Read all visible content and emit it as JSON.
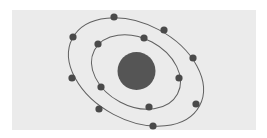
{
  "diagram": {
    "type": "atom-model",
    "colors": {
      "background": "#ebebeb",
      "page": "#ffffff",
      "orbit": "#606060",
      "nucleus": "#555555",
      "electron": "#4a4a4a"
    },
    "nucleus": {
      "cx": 136.5,
      "cy": 71,
      "r": 19
    },
    "orbits": [
      {
        "name": "inner-orbit",
        "cx": 136,
        "cy": 72,
        "rx": 47,
        "ry": 34,
        "rotate": 28
      },
      {
        "name": "outer-orbit",
        "cx": 136,
        "cy": 72,
        "rx": 72,
        "ry": 48,
        "rotate": 28
      }
    ],
    "electrons": {
      "inner": [
        {
          "x": 144,
          "y": 38
        },
        {
          "x": 98,
          "y": 44
        },
        {
          "x": 179,
          "y": 78
        },
        {
          "x": 101,
          "y": 87
        },
        {
          "x": 149,
          "y": 107
        }
      ],
      "outer": [
        {
          "x": 114,
          "y": 17
        },
        {
          "x": 164,
          "y": 30
        },
        {
          "x": 73,
          "y": 37
        },
        {
          "x": 193,
          "y": 58
        },
        {
          "x": 72,
          "y": 78
        },
        {
          "x": 196,
          "y": 104
        },
        {
          "x": 99,
          "y": 109
        },
        {
          "x": 153,
          "y": 126
        }
      ]
    },
    "electron_radius": 3.6
  }
}
